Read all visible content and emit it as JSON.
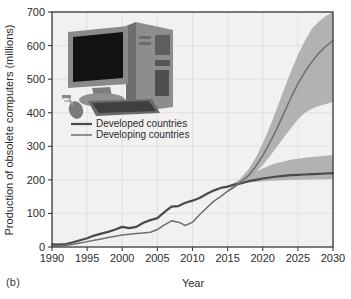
{
  "figure": {
    "panel_label": "(b)",
    "inset_image_name": "desktop-computer-photo"
  },
  "chart_data": {
    "type": "line",
    "title": "",
    "xlabel": "Year",
    "ylabel": "Production of obsolete computers (millions)",
    "xlim": [
      1990,
      2030
    ],
    "ylim": [
      0,
      700
    ],
    "xticks": [
      1990,
      1995,
      2000,
      2005,
      2010,
      2015,
      2020,
      2025,
      2030
    ],
    "yticks": [
      0,
      100,
      200,
      300,
      400,
      500,
      600,
      700
    ],
    "grid": true,
    "legend_position": "upper-left-inside",
    "x": [
      1990,
      1991,
      1992,
      1993,
      1994,
      1995,
      1996,
      1997,
      1998,
      1999,
      2000,
      2001,
      2002,
      2003,
      2004,
      2005,
      2006,
      2007,
      2008,
      2009,
      2010,
      2011,
      2012,
      2013,
      2014,
      2015,
      2016,
      2017,
      2018,
      2019,
      2020,
      2021,
      2022,
      2023,
      2024,
      2025,
      2026,
      2027,
      2028,
      2029,
      2030
    ],
    "series": [
      {
        "name": "Developed countries",
        "color": "#4a4a4a",
        "values": [
          8,
          7,
          9,
          14,
          20,
          26,
          34,
          40,
          45,
          52,
          60,
          56,
          60,
          72,
          80,
          86,
          104,
          120,
          122,
          132,
          138,
          146,
          158,
          168,
          176,
          180,
          186,
          190,
          196,
          200,
          204,
          207,
          210,
          212,
          214,
          215,
          216,
          217,
          218,
          219,
          220
        ],
        "band_low": [
          8,
          7,
          9,
          14,
          20,
          26,
          34,
          40,
          45,
          52,
          60,
          56,
          60,
          72,
          80,
          86,
          104,
          120,
          122,
          132,
          138,
          146,
          158,
          168,
          176,
          180,
          186,
          189,
          192,
          194,
          196,
          197,
          198,
          199,
          200,
          200,
          201,
          201,
          202,
          202,
          203
        ],
        "band_high": [
          8,
          7,
          9,
          14,
          20,
          26,
          34,
          40,
          45,
          52,
          60,
          56,
          60,
          72,
          80,
          86,
          104,
          120,
          122,
          132,
          138,
          146,
          158,
          168,
          176,
          182,
          192,
          200,
          212,
          224,
          234,
          243,
          250,
          255,
          260,
          263,
          266,
          268,
          270,
          272,
          274
        ]
      },
      {
        "name": "Developing countries",
        "color": "#6f6f6f",
        "values": [
          4,
          4,
          5,
          8,
          12,
          16,
          20,
          24,
          28,
          32,
          36,
          38,
          40,
          42,
          44,
          52,
          66,
          78,
          74,
          64,
          74,
          96,
          116,
          136,
          150,
          166,
          180,
          196,
          214,
          240,
          272,
          310,
          352,
          398,
          444,
          486,
          522,
          552,
          578,
          598,
          615
        ],
        "band_low": [
          4,
          4,
          5,
          8,
          12,
          16,
          20,
          24,
          28,
          32,
          36,
          38,
          40,
          42,
          44,
          52,
          66,
          78,
          74,
          64,
          74,
          96,
          116,
          136,
          150,
          164,
          176,
          190,
          204,
          222,
          244,
          270,
          298,
          326,
          354,
          380,
          400,
          412,
          420,
          426,
          432
        ],
        "band_high": [
          4,
          4,
          5,
          8,
          12,
          16,
          20,
          24,
          28,
          32,
          36,
          38,
          40,
          42,
          44,
          52,
          66,
          78,
          74,
          64,
          74,
          96,
          116,
          136,
          152,
          170,
          188,
          208,
          232,
          266,
          308,
          358,
          412,
          468,
          522,
          572,
          614,
          650,
          672,
          688,
          700
        ]
      }
    ],
    "legend": [
      {
        "label": "Developed countries",
        "color": "#4a4a4a"
      },
      {
        "label": "Developing countries",
        "color": "#6f6f6f"
      }
    ],
    "colors": {
      "plot_background": "#f2f1ef",
      "grid": "#dcdcda",
      "axis": "#3a3a3a",
      "band": "#a9a9a9"
    }
  }
}
